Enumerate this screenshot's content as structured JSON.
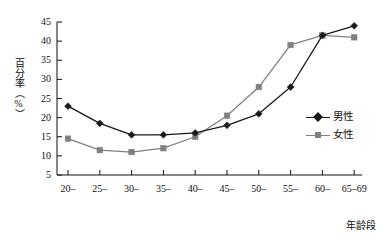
{
  "chart_data": {
    "type": "line",
    "title": "",
    "xlabel": "年龄段",
    "ylabel": "百分率（%）",
    "categories": [
      "20–",
      "25–",
      "30–",
      "35–",
      "40–",
      "45–",
      "50–",
      "55–",
      "60–",
      "65–69"
    ],
    "ylim": [
      5,
      45
    ],
    "yticks": [
      5,
      10,
      15,
      20,
      25,
      30,
      35,
      40,
      45
    ],
    "ytick_labels": [
      "5",
      "10",
      "15",
      "20",
      "25",
      "30",
      "35",
      "40",
      "45"
    ],
    "grid": false,
    "legend_position": "right",
    "series": [
      {
        "name": "男性",
        "color": "#1a1a1a",
        "marker": "diamond",
        "values": [
          23,
          18.5,
          15.5,
          15.5,
          16,
          18,
          21,
          28,
          41.5,
          44
        ]
      },
      {
        "name": "女性",
        "color": "#808080",
        "marker": "square",
        "values": [
          14.5,
          11.5,
          11,
          12,
          15,
          20.5,
          28,
          39,
          41.5,
          41
        ]
      }
    ]
  },
  "legend": {
    "items": [
      {
        "label": "男性"
      },
      {
        "label": "女性"
      }
    ]
  },
  "axes": {
    "y_label": "百分率（%）",
    "x_label": "年龄段"
  }
}
